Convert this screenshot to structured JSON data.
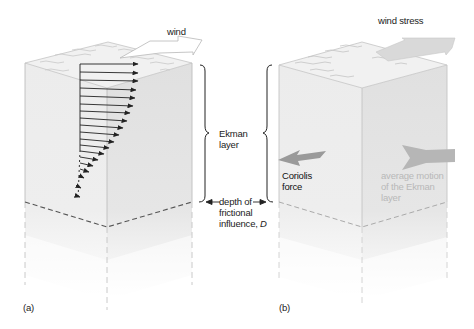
{
  "figure": {
    "panel_a": {
      "label": "(a)",
      "wind_label": "wind",
      "ekman_layer_label_line1": "Ekman",
      "ekman_layer_label_line2": "layer",
      "depth_label_line1": "depth of",
      "depth_label_line2": "frictional",
      "depth_label_line3": "influence, ",
      "depth_symbol": "D",
      "velocity_arrow_count": 19
    },
    "panel_b": {
      "label": "(b)",
      "wind_stress_label": "wind stress",
      "coriolis_label_line1": "Coriolis",
      "coriolis_label_line2": "force",
      "average_motion_line1": "average motion",
      "average_motion_line2": "of the Ekman",
      "average_motion_line3": "layer"
    },
    "colors": {
      "cube_left_face": "#ececec",
      "cube_right_face": "#e2e2e2",
      "cube_top": "#f0f0f0",
      "edge": "#bdbdbd",
      "dashed_boundary": "#555555",
      "velocity_arrows": "#222222",
      "wind_stress_arrow": "#d9d9d9",
      "coriolis_arrow": "#9a9a9a",
      "average_motion_arrow": "#b0b0b0",
      "text": "#222222",
      "faint_text": "#b8b8b8"
    }
  }
}
